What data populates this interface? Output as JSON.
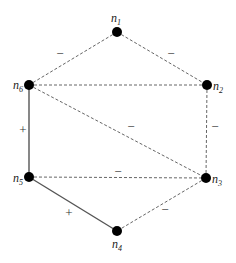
{
  "nodes": [
    {
      "id": "n1",
      "base": "n",
      "sub": "1",
      "x": 117,
      "y": 32,
      "lx": 111,
      "ly": 22
    },
    {
      "id": "n2",
      "base": "n",
      "sub": "2",
      "x": 207,
      "y": 85,
      "lx": 213,
      "ly": 90
    },
    {
      "id": "n3",
      "base": "n",
      "sub": "3",
      "x": 206,
      "y": 178,
      "lx": 212,
      "ly": 183
    },
    {
      "id": "n4",
      "base": "n",
      "sub": "4",
      "x": 117,
      "y": 231,
      "lx": 112,
      "ly": 248
    },
    {
      "id": "n5",
      "base": "n",
      "sub": "5",
      "x": 29,
      "y": 177,
      "lx": 13,
      "ly": 182
    },
    {
      "id": "n6",
      "base": "n",
      "sub": "6",
      "x": 29,
      "y": 85,
      "lx": 13,
      "ly": 89
    }
  ],
  "edges": [
    {
      "from": "n1",
      "to": "n6",
      "sign": "−",
      "style": "dashed",
      "sx": 60,
      "sy": 58
    },
    {
      "from": "n1",
      "to": "n2",
      "sign": "−",
      "style": "dashed",
      "sx": 171,
      "sy": 58
    },
    {
      "from": "n6",
      "to": "n2",
      "sign": "",
      "style": "dashed",
      "sx": 0,
      "sy": 0
    },
    {
      "from": "n2",
      "to": "n3",
      "sign": "−",
      "style": "dashed",
      "sx": 215,
      "sy": 131
    },
    {
      "from": "n6",
      "to": "n3",
      "sign": "−",
      "style": "dashed",
      "sx": 131,
      "sy": 131
    },
    {
      "from": "n6",
      "to": "n5",
      "sign": "+",
      "style": "solid",
      "sx": 23,
      "sy": 134
    },
    {
      "from": "n5",
      "to": "n3",
      "sign": "−",
      "style": "dashed",
      "sx": 118,
      "sy": 176
    },
    {
      "from": "n5",
      "to": "n4",
      "sign": "+",
      "style": "solid",
      "sx": 69,
      "sy": 217
    },
    {
      "from": "n3",
      "to": "n4",
      "sign": "−",
      "style": "dashed",
      "sx": 165,
      "sy": 214
    }
  ]
}
